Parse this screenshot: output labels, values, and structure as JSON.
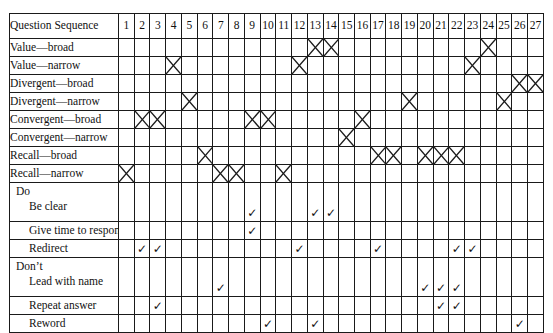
{
  "table": {
    "header_label": "Question Sequence",
    "columns": [
      "1",
      "2",
      "3",
      "4",
      "5",
      "6",
      "7",
      "8",
      "9",
      "10",
      "11",
      "12",
      "13",
      "14",
      "15",
      "16",
      "17",
      "18",
      "19",
      "20",
      "21",
      "22",
      "23",
      "24",
      "25",
      "26",
      "27"
    ],
    "mark_symbols": {
      "x": "cross",
      "check": "✓"
    },
    "rows": [
      {
        "group": "",
        "label": "Value—broad",
        "indent": false,
        "mark": "x",
        "cols": [
          13,
          14,
          24
        ]
      },
      {
        "group": "",
        "label": "Value—narrow",
        "indent": false,
        "mark": "x",
        "cols": [
          4,
          12,
          23
        ]
      },
      {
        "group": "",
        "label": "Divergent—broad",
        "indent": false,
        "mark": "x",
        "cols": [
          26,
          27
        ]
      },
      {
        "group": "",
        "label": "Divergent—narrow",
        "indent": false,
        "mark": "x",
        "cols": [
          5,
          19,
          25
        ]
      },
      {
        "group": "",
        "label": "Convergent—broad",
        "indent": false,
        "mark": "x",
        "cols": [
          2,
          3,
          9,
          10,
          16
        ]
      },
      {
        "group": "",
        "label": "Convergent—narrow",
        "indent": false,
        "mark": "x",
        "cols": [
          15
        ]
      },
      {
        "group": "",
        "label": "Recall—broad",
        "indent": false,
        "mark": "x",
        "cols": [
          6,
          17,
          18,
          20,
          21,
          22
        ]
      },
      {
        "group": "",
        "label": "Recall—narrow",
        "indent": false,
        "mark": "x",
        "cols": [
          1,
          7,
          8,
          11
        ]
      },
      {
        "group": "Do",
        "label": "Be clear",
        "indent": true,
        "mark": "check",
        "cols": [
          9,
          13,
          14
        ]
      },
      {
        "group": "",
        "label": "Give time to respond",
        "indent": true,
        "mark": "check",
        "cols": [
          9
        ]
      },
      {
        "group": "",
        "label": "Redirect",
        "indent": true,
        "mark": "check",
        "cols": [
          2,
          3,
          12,
          17,
          22,
          23
        ]
      },
      {
        "group": "Don’t",
        "label": "Lead with name",
        "indent": true,
        "mark": "check",
        "cols": [
          7,
          20,
          21,
          22
        ]
      },
      {
        "group": "",
        "label": "Repeat answer",
        "indent": true,
        "mark": "check",
        "cols": [
          3,
          21,
          22
        ]
      },
      {
        "group": "",
        "label": "Reword",
        "indent": true,
        "mark": "check",
        "cols": [
          10,
          13,
          26
        ]
      }
    ]
  }
}
